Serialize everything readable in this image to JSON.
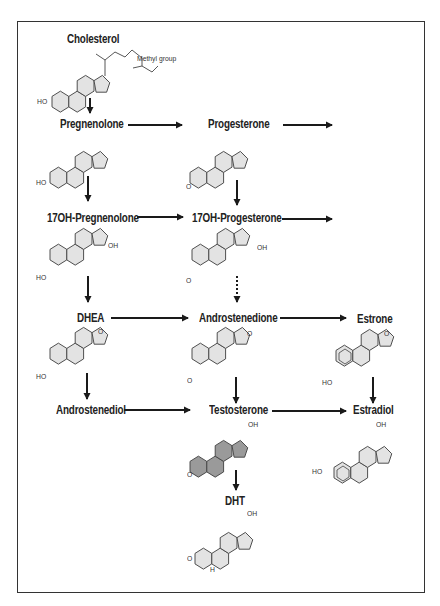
{
  "diagram": {
    "colors": {
      "ring_fill": "#e3e3e3",
      "ring_fill_highlight": "#9a9a9a",
      "line": "#333333",
      "arrow": "#1a1a1a",
      "frame": "#333333"
    },
    "nodes": {
      "cholesterol": {
        "label": "Cholesterol",
        "annotation": "Methyl group",
        "substituent": "HO"
      },
      "pregnenolone": {
        "label": "Pregnenolone",
        "substituent": "HO"
      },
      "progesterone": {
        "label": "Progesterone",
        "substituent": "O"
      },
      "oh17_pregnenolone": {
        "label": "17OH-Pregnenolone",
        "substituent": "HO",
        "oh": "OH"
      },
      "oh17_progesterone": {
        "label": "17OH-Progesterone",
        "substituent": "O",
        "oh": "OH"
      },
      "dhea": {
        "label": "DHEA",
        "substituent": "HO",
        "keto": "O"
      },
      "androstenedione": {
        "label": "Androstenedione",
        "substituent": "O",
        "keto": "O"
      },
      "estrone": {
        "label": "Estrone",
        "substituent": "HO",
        "keto": "O"
      },
      "androstenediol": {
        "label": "Androstenediol"
      },
      "testosterone": {
        "label": "Testosterone",
        "substituent": "O",
        "oh": "OH"
      },
      "estradiol": {
        "label": "Estradiol",
        "substituent": "HO",
        "oh": "OH"
      },
      "dht": {
        "label": "DHT",
        "substituent": "O",
        "oh": "OH",
        "h": "H"
      }
    },
    "edges": [
      {
        "from": "cholesterol",
        "to": "pregnenolone",
        "style": "solid"
      },
      {
        "from": "pregnenolone",
        "to": "progesterone",
        "style": "solid"
      },
      {
        "from": "progesterone",
        "to": "(offscreen)",
        "style": "solid"
      },
      {
        "from": "pregnenolone",
        "to": "oh17_pregnenolone",
        "style": "solid"
      },
      {
        "from": "progesterone",
        "to": "oh17_progesterone",
        "style": "solid"
      },
      {
        "from": "oh17_pregnenolone",
        "to": "oh17_progesterone",
        "style": "solid"
      },
      {
        "from": "oh17_progesterone",
        "to": "(offscreen)",
        "style": "solid"
      },
      {
        "from": "oh17_pregnenolone",
        "to": "dhea",
        "style": "solid"
      },
      {
        "from": "oh17_progesterone",
        "to": "androstenedione",
        "style": "dotted"
      },
      {
        "from": "dhea",
        "to": "androstenedione",
        "style": "solid"
      },
      {
        "from": "androstenedione",
        "to": "estrone",
        "style": "solid"
      },
      {
        "from": "dhea",
        "to": "androstenediol",
        "style": "solid"
      },
      {
        "from": "androstenedione",
        "to": "testosterone",
        "style": "solid"
      },
      {
        "from": "estrone",
        "to": "estradiol",
        "style": "solid"
      },
      {
        "from": "androstenediol",
        "to": "testosterone",
        "style": "solid"
      },
      {
        "from": "testosterone",
        "to": "estradiol",
        "style": "solid"
      },
      {
        "from": "testosterone",
        "to": "dht",
        "style": "solid"
      }
    ]
  }
}
